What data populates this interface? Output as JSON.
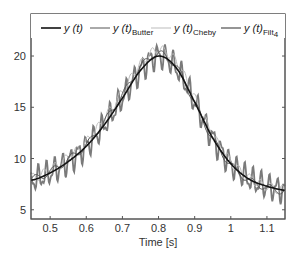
{
  "chart_data": {
    "type": "line",
    "title": "",
    "xlabel": "Time [s]",
    "ylabel": "",
    "xlim": [
      0.447,
      1.15
    ],
    "ylim": [
      4.1,
      24.1
    ],
    "grid": false,
    "legend_position": "top-inside",
    "x_ticks": [
      0.5,
      0.6,
      0.7,
      0.8,
      0.9,
      1.0,
      1.1
    ],
    "x_tick_labels": [
      "0.5",
      "0.6",
      "0.7",
      "0.8",
      "0.9",
      "1",
      "1.1"
    ],
    "y_ticks": [
      5,
      10,
      15,
      20
    ],
    "y_tick_labels": [
      "5",
      "10",
      "15",
      "20"
    ],
    "series": [
      {
        "name": "y(t)",
        "legend_main": "y (t)",
        "legend_sub": "",
        "color": "#111111",
        "width": 1.6,
        "x": [
          0.45,
          0.5,
          0.55,
          0.6,
          0.65,
          0.7,
          0.75,
          0.8,
          0.85,
          0.9,
          0.95,
          1.0,
          1.05,
          1.1,
          1.15
        ],
        "values": [
          7.9,
          8.6,
          9.7,
          11.2,
          13.3,
          15.9,
          18.6,
          20.0,
          18.8,
          15.5,
          12.0,
          9.5,
          8.0,
          7.3,
          6.9
        ]
      },
      {
        "name": "y(t)_Butter",
        "legend_main": "y (t)",
        "legend_sub": "Butter",
        "color": "#555555",
        "width": 1.0,
        "x": [
          0.45,
          0.5,
          0.55,
          0.6,
          0.65,
          0.7,
          0.75,
          0.8,
          0.85,
          0.9,
          0.95,
          1.0,
          1.05,
          1.1,
          1.15
        ],
        "values": [
          8.0,
          8.7,
          9.9,
          11.3,
          13.6,
          16.2,
          18.9,
          20.2,
          18.9,
          15.4,
          11.9,
          9.4,
          7.9,
          7.2,
          6.8
        ]
      },
      {
        "name": "y(t)_Cheby",
        "legend_main": "y (t)",
        "legend_sub": "Cheby",
        "color": "#bbbbbb",
        "width": 1.0,
        "x": [
          0.45,
          0.5,
          0.55,
          0.6,
          0.65,
          0.7,
          0.75,
          0.8,
          0.85,
          0.9,
          0.95,
          1.0,
          1.05,
          1.1,
          1.15
        ],
        "values": [
          8.1,
          8.9,
          10.1,
          11.6,
          13.9,
          16.5,
          19.2,
          20.6,
          19.4,
          15.9,
          12.3,
          9.7,
          8.1,
          7.3,
          6.9
        ]
      },
      {
        "name": "y(t)_Filt4",
        "legend_main": "y (t)",
        "legend_sub": "Filt",
        "legend_subsub": "4",
        "color": "#7a7a7a",
        "width": 1.8,
        "noisy": true,
        "noise_amplitude": 1.4,
        "noise_period_s": 0.022,
        "x": [
          0.45,
          0.5,
          0.55,
          0.6,
          0.65,
          0.7,
          0.75,
          0.8,
          0.85,
          0.9,
          0.95,
          1.0,
          1.05,
          1.1,
          1.15
        ],
        "values": [
          7.9,
          8.6,
          9.7,
          11.2,
          13.3,
          15.9,
          18.6,
          20.0,
          18.8,
          15.5,
          12.0,
          9.5,
          8.0,
          7.3,
          6.9
        ]
      }
    ]
  }
}
